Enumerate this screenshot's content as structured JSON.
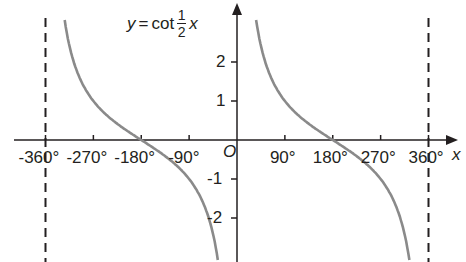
{
  "chart_data": {
    "type": "line",
    "title_parts": {
      "lhs": "y",
      "eq": "=",
      "func": "cot",
      "num": "1",
      "den": "2",
      "var": "x"
    },
    "xlabel": "x",
    "ylabel": "y",
    "origin_label": "O",
    "x_ticks": [
      -360,
      -270,
      -180,
      -90,
      90,
      180,
      270,
      360
    ],
    "x_tick_labels": [
      "-360°",
      "-270°",
      "-180°",
      "-90°",
      "90°",
      "180°",
      "270°",
      "360°"
    ],
    "y_ticks": [
      -2,
      -1,
      1,
      2
    ],
    "y_tick_labels": [
      "-2",
      "-1",
      "1",
      "2"
    ],
    "xlim": [
      -400,
      420
    ],
    "ylim": [
      -3.1,
      3.1
    ],
    "asymptotes": [
      -360,
      360
    ],
    "grid": false,
    "series": [
      {
        "name": "y = cot(x/2) branch 1",
        "domain": [
          -330,
          -30
        ],
        "color": "#8a8a8a"
      },
      {
        "name": "y = cot(x/2) branch 2",
        "domain": [
          30,
          330
        ],
        "color": "#8a8a8a"
      }
    ],
    "sample_points": [
      {
        "x": -180,
        "y": 0
      },
      {
        "x": 180,
        "y": 0
      },
      {
        "x": -270,
        "y": 1
      },
      {
        "x": -90,
        "y": -1
      },
      {
        "x": 90,
        "y": 1
      },
      {
        "x": 270,
        "y": -1
      }
    ]
  },
  "colors": {
    "axis": "#231f20",
    "curve": "#8a8a8a",
    "asymptote": "#231f20"
  }
}
